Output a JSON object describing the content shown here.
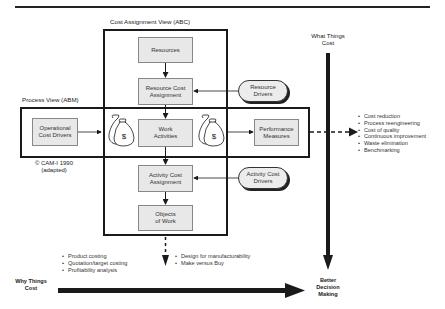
{
  "titles": {
    "abc_view": "Cost Assignment View (ABC)",
    "abm_view": "Process View (ABM)",
    "what_things_cost": [
      "What Things",
      "Cost"
    ],
    "why_things_cost": [
      "Why Things",
      "Cost"
    ],
    "better_decision_making": [
      "Better",
      "Decision",
      "Making"
    ],
    "copyright": [
      "© CAM-I 1990",
      "(adapted)"
    ]
  },
  "nodes": {
    "resources": "Resources",
    "resource_cost_assignment": [
      "Resource Cost",
      "Assignment"
    ],
    "work_activities": [
      "Work",
      "Activities"
    ],
    "activity_cost_assignment": [
      "Activity Cost",
      "Assignment"
    ],
    "objects_of_work": [
      "Objects",
      "of Work"
    ],
    "operational_cost_drivers": [
      "Operational",
      "Cost Drivers"
    ],
    "performance_measures": [
      "Performance",
      "Measures"
    ],
    "resource_drivers": [
      "Resource",
      "Drivers"
    ],
    "activity_cost_drivers": [
      "Activity Cost",
      "Drivers"
    ]
  },
  "icons": {
    "money_bag_symbol": "$"
  },
  "bullets": {
    "process_outcomes": [
      "Cost reduction",
      "Process reengineering",
      "Cost of quality",
      "Continuous improvement",
      "Waste elimination",
      "Benchmarking"
    ],
    "costing_outcomes": [
      "Product costing",
      "Quotation/target costing",
      "Profitability analysis"
    ],
    "design_outcomes": [
      "Design for manufacturability",
      "Make versus Buy"
    ]
  },
  "colors": {
    "frame": "#1a1a1a",
    "node_fill": "#e8e8e8",
    "node_border": "#888888",
    "arrow": "#1a1a1a"
  }
}
